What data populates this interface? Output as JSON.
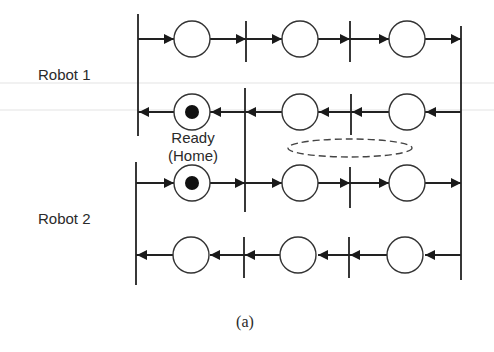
{
  "diagram": {
    "labels": {
      "robot1": "Robot 1",
      "robot2": "Robot 2",
      "ready_line1": "Ready",
      "ready_line2": "(Home)",
      "caption": "(a)"
    },
    "rows": [
      {
        "name": "robot1-forward",
        "y": 39,
        "direction": "right",
        "places": [
          {
            "x": 192,
            "token": false
          },
          {
            "x": 300,
            "token": false
          },
          {
            "x": 407,
            "token": false
          }
        ]
      },
      {
        "name": "robot1-return",
        "y": 112,
        "direction": "left",
        "places": [
          {
            "x": 192,
            "token": true
          },
          {
            "x": 300,
            "token": false
          },
          {
            "x": 407,
            "token": false
          }
        ]
      },
      {
        "name": "robot2-forward",
        "y": 183,
        "direction": "right",
        "places": [
          {
            "x": 192,
            "token": true
          },
          {
            "x": 300,
            "token": false
          },
          {
            "x": 407,
            "token": false
          }
        ]
      },
      {
        "name": "robot2-return",
        "y": 255,
        "direction": "left",
        "places": [
          {
            "x": 192,
            "token": false
          },
          {
            "x": 300,
            "token": false
          },
          {
            "x": 407,
            "token": false
          }
        ]
      }
    ],
    "shared_resource": {
      "shape": "dashed-ellipse",
      "cx": 350,
      "cy": 148,
      "rx": 63,
      "ry": 9
    },
    "colors": {
      "stroke": "#222222",
      "token": "#111111",
      "background": "#ffffff"
    }
  }
}
